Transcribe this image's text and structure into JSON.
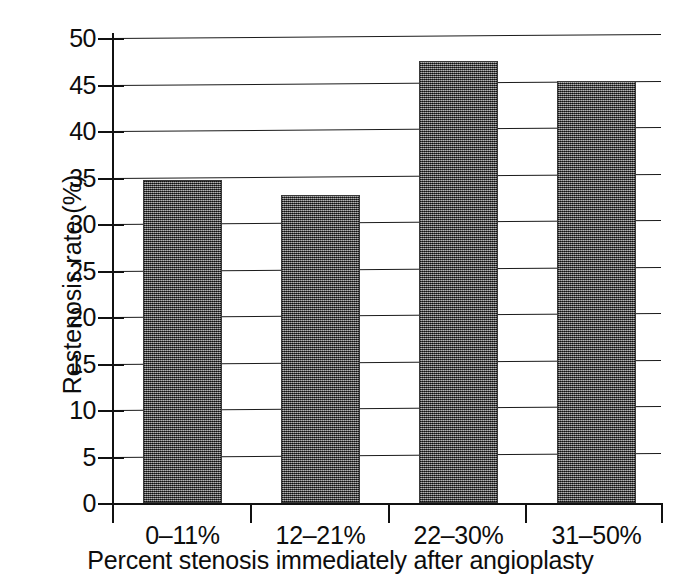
{
  "chart_data": {
    "type": "bar",
    "title": "",
    "xlabel": "Percent stenosis immediately after angioplasty",
    "ylabel": "Restenosis rate (%)",
    "categories": [
      "0–11%",
      "12–21%",
      "22–30%",
      "31–50%"
    ],
    "values": [
      34.7,
      33.1,
      47.5,
      45.4
    ],
    "ylim": [
      0,
      50
    ],
    "ytick_labels": [
      "0",
      "5",
      "10",
      "15",
      "20",
      "25",
      "30",
      "35",
      "40",
      "45",
      "50"
    ],
    "ytick_values": [
      0,
      5,
      10,
      15,
      20,
      25,
      30,
      35,
      40,
      45,
      50
    ],
    "grid": "horizontal",
    "legend": "none",
    "bar_color": "#4d4d4d",
    "axis_color": "#111111"
  }
}
